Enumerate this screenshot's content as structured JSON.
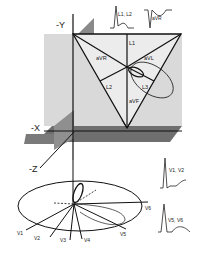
{
  "axes": {
    "neg_y": "-Y",
    "neg_x": "-X",
    "neg_z": "-Z"
  },
  "frontal_leads": {
    "l1": "L1",
    "l2": "L2",
    "l3": "L3",
    "avr": "aVR",
    "avl": "aVL",
    "avf": "aVF"
  },
  "precordial_leads": {
    "v1": "V1",
    "v2": "V2",
    "v3": "V3",
    "v4": "V4",
    "v5": "V5",
    "v6": "V6"
  },
  "waveform_labels": {
    "l1_l2": "L1, L2",
    "avr": "aVR",
    "v1_v2": "V1, V2",
    "v5_v6": "V5, V6"
  },
  "colors": {
    "frontal_plane": "#d6d6d6",
    "sagittal_plane": "#8a8a8a",
    "horizontal_plane": "#6f6f6f",
    "line": "#111111"
  }
}
